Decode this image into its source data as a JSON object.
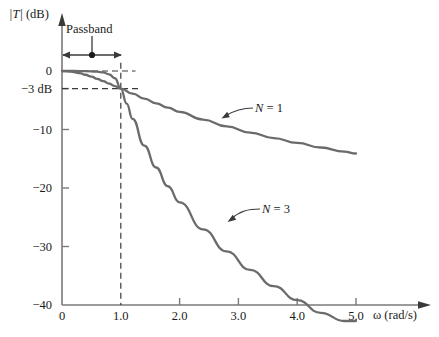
{
  "figure": {
    "background": "#ffffff",
    "curve_color": "#6b6b6b",
    "axis_color": "#7a7a7a",
    "text_color": "#1a1a1a"
  },
  "chart_data": {
    "type": "line",
    "title": "",
    "xlabel": "ω (rad/s)",
    "ylabel": "|T| (dB)",
    "xlim": [
      0,
      5.4
    ],
    "ylim": [
      -40,
      3
    ],
    "grid": false,
    "legend_position": "inline-annotations",
    "x_ticks": [
      {
        "value": 0,
        "label": "0"
      },
      {
        "value": 1.0,
        "label": "1.0"
      },
      {
        "value": 2.0,
        "label": "2.0"
      },
      {
        "value": 3.0,
        "label": "3.0"
      },
      {
        "value": 4.0,
        "label": "4.0"
      },
      {
        "value": 5.0,
        "label": "5.0"
      }
    ],
    "y_ticks": [
      {
        "value": 0,
        "label": "0"
      },
      {
        "value": -3,
        "label": "−3 dB"
      },
      {
        "value": -10,
        "label": "−10"
      },
      {
        "value": -20,
        "label": "−20"
      },
      {
        "value": -30,
        "label": "−30"
      },
      {
        "value": -40,
        "label": "−40"
      }
    ],
    "series": [
      {
        "name": "N = 1",
        "label": "N = 1",
        "points": [
          [
            0.0,
            -0.02
          ],
          [
            0.1,
            -0.04
          ],
          [
            0.2,
            -0.17
          ],
          [
            0.3,
            -0.37
          ],
          [
            0.4,
            -0.64
          ],
          [
            0.5,
            -0.97
          ],
          [
            0.6,
            -1.34
          ],
          [
            0.7,
            -1.73
          ],
          [
            0.8,
            -2.15
          ],
          [
            0.9,
            -2.57
          ],
          [
            1.0,
            -3.01
          ],
          [
            1.2,
            -3.88
          ],
          [
            1.4,
            -4.72
          ],
          [
            1.6,
            -5.52
          ],
          [
            1.8,
            -6.26
          ],
          [
            2.0,
            -6.99
          ],
          [
            2.4,
            -8.3
          ],
          [
            2.8,
            -9.47
          ],
          [
            3.2,
            -10.52
          ],
          [
            3.6,
            -11.46
          ],
          [
            4.0,
            -12.3
          ],
          [
            4.4,
            -13.08
          ],
          [
            4.8,
            -13.78
          ],
          [
            5.0,
            -14.1
          ]
        ]
      },
      {
        "name": "N = 3",
        "label": "N = 3",
        "points": [
          [
            0.0,
            0.0
          ],
          [
            0.2,
            0.0
          ],
          [
            0.4,
            -0.02
          ],
          [
            0.6,
            -0.12
          ],
          [
            0.7,
            -0.25
          ],
          [
            0.8,
            -0.56
          ],
          [
            0.9,
            -1.24
          ],
          [
            1.0,
            -3.01
          ],
          [
            1.1,
            -5.57
          ],
          [
            1.2,
            -8.18
          ],
          [
            1.4,
            -12.74
          ],
          [
            1.6,
            -16.5
          ],
          [
            1.8,
            -19.7
          ],
          [
            2.0,
            -22.46
          ],
          [
            2.4,
            -27.07
          ],
          [
            2.8,
            -30.83
          ],
          [
            3.2,
            -34.01
          ],
          [
            3.6,
            -36.76
          ],
          [
            4.0,
            -39.18
          ],
          [
            4.4,
            -41.34
          ],
          [
            4.8,
            -43.29
          ],
          [
            5.0,
            -44.2
          ]
        ]
      }
    ],
    "annotations": [
      {
        "name": "passband",
        "label": "Passband",
        "type": "double-arrow-with-marker",
        "x_start": 0.0,
        "x_end": 1.0,
        "marker_x": 0.5
      },
      {
        "name": "cutoff-guide-0db",
        "type": "dashed-horizontal",
        "y": 0,
        "x_start": 0.0,
        "x_end": 1.25
      },
      {
        "name": "cutoff-guide-3db",
        "type": "dashed-horizontal",
        "y": -3,
        "x_start": 0.0,
        "x_end": 1.3
      },
      {
        "name": "cutoff-guide-vertical",
        "type": "dashed-vertical",
        "x": 1.0,
        "y_start": 1.4,
        "y_end": -40
      }
    ]
  }
}
